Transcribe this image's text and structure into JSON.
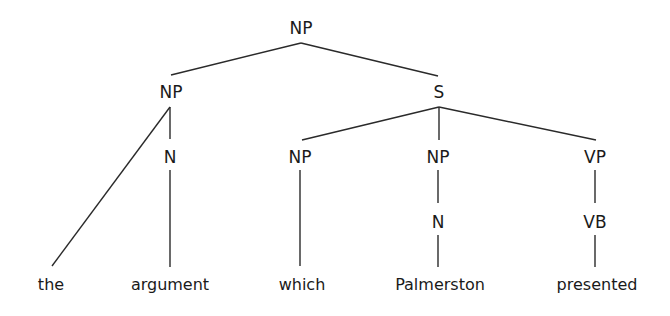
{
  "diagram": {
    "type": "syntax-tree",
    "nodes": {
      "root_np": {
        "label": "NP",
        "x": 301,
        "y": 18
      },
      "np_left": {
        "label": "NP",
        "x": 171,
        "y": 82
      },
      "s": {
        "label": "S",
        "x": 439,
        "y": 82
      },
      "n_left": {
        "label": "N",
        "x": 170,
        "y": 147
      },
      "np_which": {
        "label": "NP",
        "x": 300,
        "y": 147
      },
      "np_palmerston": {
        "label": "NP",
        "x": 438,
        "y": 147
      },
      "vp": {
        "label": "VP",
        "x": 595,
        "y": 147
      },
      "n_palmerston": {
        "label": "N",
        "x": 438,
        "y": 212
      },
      "vb": {
        "label": "VB",
        "x": 595,
        "y": 212
      }
    },
    "leaves": {
      "the": {
        "label": "the",
        "x": 51,
        "y": 275
      },
      "argument": {
        "label": "argument",
        "x": 170,
        "y": 275
      },
      "which": {
        "label": "which",
        "x": 302,
        "y": 275
      },
      "palmerston": {
        "label": "Palmerston",
        "x": 440,
        "y": 275
      },
      "presented": {
        "label": "presented",
        "x": 597,
        "y": 275
      }
    },
    "edges": [
      {
        "from": "root_np",
        "to": "np_left",
        "x1": 301,
        "y1": 43,
        "x2": 171,
        "y2": 75
      },
      {
        "from": "root_np",
        "to": "s",
        "x1": 301,
        "y1": 43,
        "x2": 438,
        "y2": 76
      },
      {
        "from": "np_left",
        "to": "the",
        "x1": 170,
        "y1": 107,
        "x2": 52,
        "y2": 266
      },
      {
        "from": "np_left",
        "to": "n_left",
        "x1": 170,
        "y1": 107,
        "x2": 170,
        "y2": 139
      },
      {
        "from": "s",
        "to": "np_which",
        "x1": 439,
        "y1": 107,
        "x2": 302,
        "y2": 140
      },
      {
        "from": "s",
        "to": "np_palmerston",
        "x1": 439,
        "y1": 107,
        "x2": 439,
        "y2": 140
      },
      {
        "from": "s",
        "to": "vp",
        "x1": 439,
        "y1": 107,
        "x2": 596,
        "y2": 140
      },
      {
        "from": "n_left",
        "to": "argument",
        "x1": 170,
        "y1": 170,
        "x2": 170,
        "y2": 267
      },
      {
        "from": "np_which",
        "to": "which",
        "x1": 300,
        "y1": 170,
        "x2": 300,
        "y2": 266
      },
      {
        "from": "np_palmerston",
        "to": "n_palmerston",
        "x1": 438,
        "y1": 170,
        "x2": 438,
        "y2": 203
      },
      {
        "from": "n_palmerston",
        "to": "palmerston",
        "x1": 438,
        "y1": 235,
        "x2": 438,
        "y2": 267
      },
      {
        "from": "vp",
        "to": "vb",
        "x1": 595,
        "y1": 170,
        "x2": 595,
        "y2": 203
      },
      {
        "from": "vb",
        "to": "presented",
        "x1": 595,
        "y1": 235,
        "x2": 595,
        "y2": 267
      }
    ]
  }
}
